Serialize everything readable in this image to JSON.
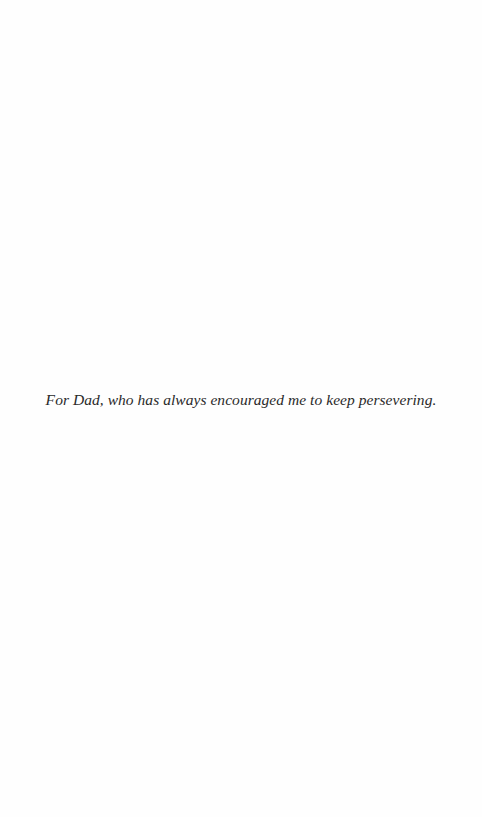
{
  "page": {
    "type": "dedication",
    "background_color": "#fefefe",
    "text_color": "#2a2a2a"
  },
  "dedication": {
    "text": "For Dad, who has always encouraged me to keep persevering."
  }
}
